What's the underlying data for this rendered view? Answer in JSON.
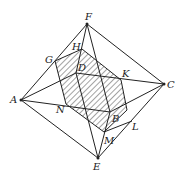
{
  "diagram": {
    "type": "octahedron-section",
    "points": {
      "F": [
        87,
        24
      ],
      "C": [
        164,
        84
      ],
      "A": [
        21,
        100
      ],
      "E": [
        98,
        158
      ],
      "D": [
        76,
        73
      ],
      "B": [
        110,
        112
      ],
      "G": [
        55,
        61
      ],
      "H": [
        82,
        49
      ],
      "K": [
        121,
        80
      ],
      "N": [
        66,
        104
      ],
      "L": [
        132,
        121
      ],
      "M": [
        104,
        132
      ]
    },
    "labels": [
      {
        "t": "F",
        "x": 85,
        "y": 20
      },
      {
        "t": "H",
        "x": 72,
        "y": 50
      },
      {
        "t": "G",
        "x": 45,
        "y": 63
      },
      {
        "t": "D",
        "x": 78,
        "y": 71
      },
      {
        "t": "K",
        "x": 122,
        "y": 77
      },
      {
        "t": "C",
        "x": 167,
        "y": 88
      },
      {
        "t": "A",
        "x": 10,
        "y": 103
      },
      {
        "t": "N",
        "x": 56,
        "y": 113
      },
      {
        "t": "B",
        "x": 112,
        "y": 122
      },
      {
        "t": "L",
        "x": 132,
        "y": 130
      },
      {
        "t": "M",
        "x": 104,
        "y": 144
      },
      {
        "t": "E",
        "x": 93,
        "y": 170
      }
    ],
    "section": [
      "G",
      "H",
      "K",
      "R",
      "M",
      "N"
    ],
    "hatch_color": "#333333",
    "line_color": "#222222"
  }
}
